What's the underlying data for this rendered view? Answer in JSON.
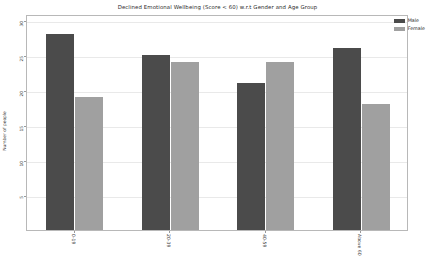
{
  "chart_data": {
    "type": "bar",
    "title": "Declined Emotional Wellbeing (Score < 60) w.r.t Gender and Age Group",
    "xlabel": "",
    "ylabel": "Number of people",
    "categories": [
      "0-19",
      "20-39",
      "40-59",
      "Above 60"
    ],
    "series": [
      {
        "name": "Male",
        "color": "#4b4b4b",
        "values": [
          28,
          25,
          21,
          26
        ]
      },
      {
        "name": "Female",
        "color": "#a0a0a0",
        "values": [
          19,
          24,
          24,
          18
        ]
      }
    ],
    "ylim": [
      0,
      30.8
    ],
    "yticks": [
      5,
      10,
      15,
      20,
      25,
      30
    ],
    "ytick_labels": [
      "5",
      "10",
      "15",
      "20",
      "25",
      "30"
    ],
    "grid": true,
    "legend_position": "upper-right"
  }
}
